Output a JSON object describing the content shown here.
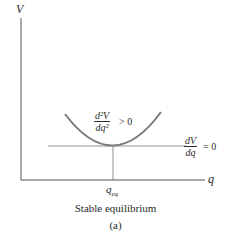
{
  "diagram": {
    "y_axis_label": "V",
    "x_axis_label": "q",
    "curve_annotation": {
      "numerator": "d²V",
      "denominator": "dq²",
      "relation": "> 0"
    },
    "tangent_annotation": {
      "numerator": "dV",
      "denominator": "dq",
      "relation": "= 0"
    },
    "equilibrium_tick_label": "q",
    "equilibrium_tick_subscript": "eq",
    "caption": "Stable equilibrium",
    "panel_label": "(a)",
    "colors": {
      "axis": "#555555",
      "curve": "#7a7a7a",
      "text": "#2a2a2a"
    }
  }
}
